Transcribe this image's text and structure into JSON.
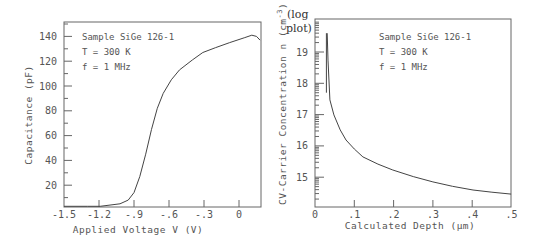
{
  "chart_data": [
    {
      "type": "line",
      "title": "",
      "xlabel": "Applied Voltage V (V)",
      "ylabel": "Capacitance (pF)",
      "xlim": [
        -1.5,
        0.19
      ],
      "ylim": [
        2,
        150
      ],
      "xticks": [
        "-1.5",
        "-1.2",
        "-.9",
        "-.6",
        "-.3",
        "0"
      ],
      "yticks": [
        "20",
        "40",
        "60",
        "80",
        "100",
        "120",
        "140"
      ],
      "grid": false,
      "annotations": [
        "Sample SiGe 126-1",
        "T = 300 K",
        "f = 1 MHz"
      ],
      "series": [
        {
          "name": "C-V",
          "x": [
            -1.5,
            -1.3,
            -1.19,
            -1.02,
            -0.95,
            -0.9,
            -0.85,
            -0.8,
            -0.75,
            -0.7,
            -0.65,
            -0.58,
            -0.51,
            -0.4,
            -0.31,
            -0.2,
            -0.08,
            0.05,
            0.11,
            0.15,
            0.18
          ],
          "values": [
            3,
            3,
            3,
            5,
            8,
            14,
            27,
            45,
            65,
            82,
            94,
            105,
            113,
            121,
            127,
            131,
            135,
            139,
            141,
            140,
            137
          ]
        }
      ]
    },
    {
      "type": "line",
      "title": "",
      "xlabel": "Calculated Depth (μm)",
      "ylabel": "CV-Carrier Concentration n (cm⁻³)",
      "ylabel_note": "(log plot)",
      "xlim": [
        0,
        0.5
      ],
      "ylim": [
        14.1,
        20.1
      ],
      "xticks": [
        "0",
        ".1",
        ".2",
        ".3",
        ".4",
        ".5"
      ],
      "yticks": [
        "15",
        "16",
        "17",
        "18",
        "19"
      ],
      "grid": false,
      "annotations": [
        "Sample SiGe 126-1",
        "T = 300 K",
        "f = 1 MHz"
      ],
      "series": [
        {
          "name": "log n",
          "x": [
            0.031,
            0.033,
            0.038,
            0.048,
            0.064,
            0.079,
            0.1,
            0.122,
            0.16,
            0.198,
            0.25,
            0.3,
            0.35,
            0.402,
            0.45,
            0.499
          ],
          "values": [
            19.6,
            18.74,
            17.47,
            16.99,
            16.51,
            16.19,
            15.9,
            15.65,
            15.42,
            15.23,
            15.02,
            14.85,
            14.71,
            14.59,
            14.52,
            14.46
          ]
        }
      ],
      "spike": {
        "x": 0.029,
        "y_from": 17.7,
        "y_to": 19.6
      }
    }
  ],
  "labels": {
    "left_annot_1": "Sample SiGe 126-1",
    "left_annot_2": "T = 300 K",
    "left_annot_3": "f = 1 MHz",
    "right_annot_1": "Sample SiGe 126-1",
    "right_annot_2": "T = 300 K",
    "right_annot_3": "f = 1 MHz",
    "left_xlabel": "Applied Voltage V (V)",
    "left_ylabel": "Capacitance (pF)",
    "right_xlabel": "Calculated Depth  (μm)",
    "right_ylabel": "CV-Carrier Concentration n (cm",
    "right_ylabel_sup": "-3",
    "right_ylabel_close": ")",
    "log_note_1": "(log",
    "log_note_2": "plot)"
  }
}
